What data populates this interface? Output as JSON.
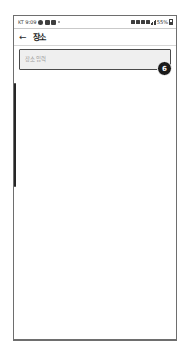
{
  "status_bar": {
    "carrier": "KT",
    "time": "9:09",
    "battery_percent": "55%",
    "left_icons": [
      "messaging-icon",
      "app-icon",
      "app-icon",
      "notification-dot-icon"
    ],
    "right_icons": [
      "alarm-icon",
      "bluetooth-icon",
      "sound-mute-icon",
      "wifi-icon",
      "signal-bars-icon",
      "battery-icon"
    ]
  },
  "app_bar": {
    "back_label": "←",
    "title": "장소"
  },
  "search": {
    "placeholder": "장소 입력",
    "value": ""
  },
  "annotation": {
    "step_number": "6"
  },
  "colors": {
    "badge_background": "#1b1b1b",
    "badge_text": "#ffffff",
    "input_border": "#4b4b4b",
    "input_background": "#efefef",
    "placeholder_text": "#9a9a9a",
    "frame_border": "#6e6e6e",
    "scrollbar_thumb": "#262626"
  }
}
